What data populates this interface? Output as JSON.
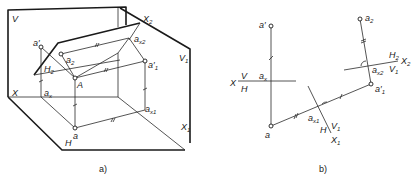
{
  "figure": {
    "panel_a": {
      "caption": "a)",
      "planes": {
        "V": "V",
        "H": "H",
        "V1": "V",
        "V1_sub": "1",
        "H2": "H",
        "H2_sub": "2"
      },
      "axes": {
        "X": "X",
        "X1": "X",
        "X1_sub": "1",
        "X2": "X",
        "X2_sub": "2"
      },
      "points": {
        "a_prime": "a′",
        "a2": "a",
        "a2_sub": "2",
        "A": "A",
        "a_x2": "a",
        "a_x2_sub": "x2",
        "a1_prime": "a′",
        "a1_prime_sub": "1",
        "a_x": "a",
        "a_x_sub": "x",
        "a_x1": "a",
        "a_x1_sub": "x1",
        "a": "a"
      }
    },
    "panel_b": {
      "caption": "b)",
      "axis_labels": {
        "X": "X",
        "V": "V",
        "H": "H",
        "X1": "X",
        "X1_sub": "1",
        "H_on_x1": "H",
        "V1_on_x1": "V",
        "V1_on_x1_sub": "1",
        "X2": "X",
        "X2_sub": "2",
        "H2": "H",
        "H2_sub": "2",
        "V1_on_x2": "V",
        "V1_on_x2_sub": "1"
      },
      "points": {
        "a_prime": "a′",
        "a_x": "a",
        "a_x_sub": "x",
        "a": "a",
        "a_x1": "a",
        "a_x1_sub": "x1",
        "a1_prime": "a′",
        "a1_prime_sub": "1",
        "a_x2": "a",
        "a_x2_sub": "x2",
        "a2": "a",
        "a2_sub": "2"
      }
    }
  }
}
